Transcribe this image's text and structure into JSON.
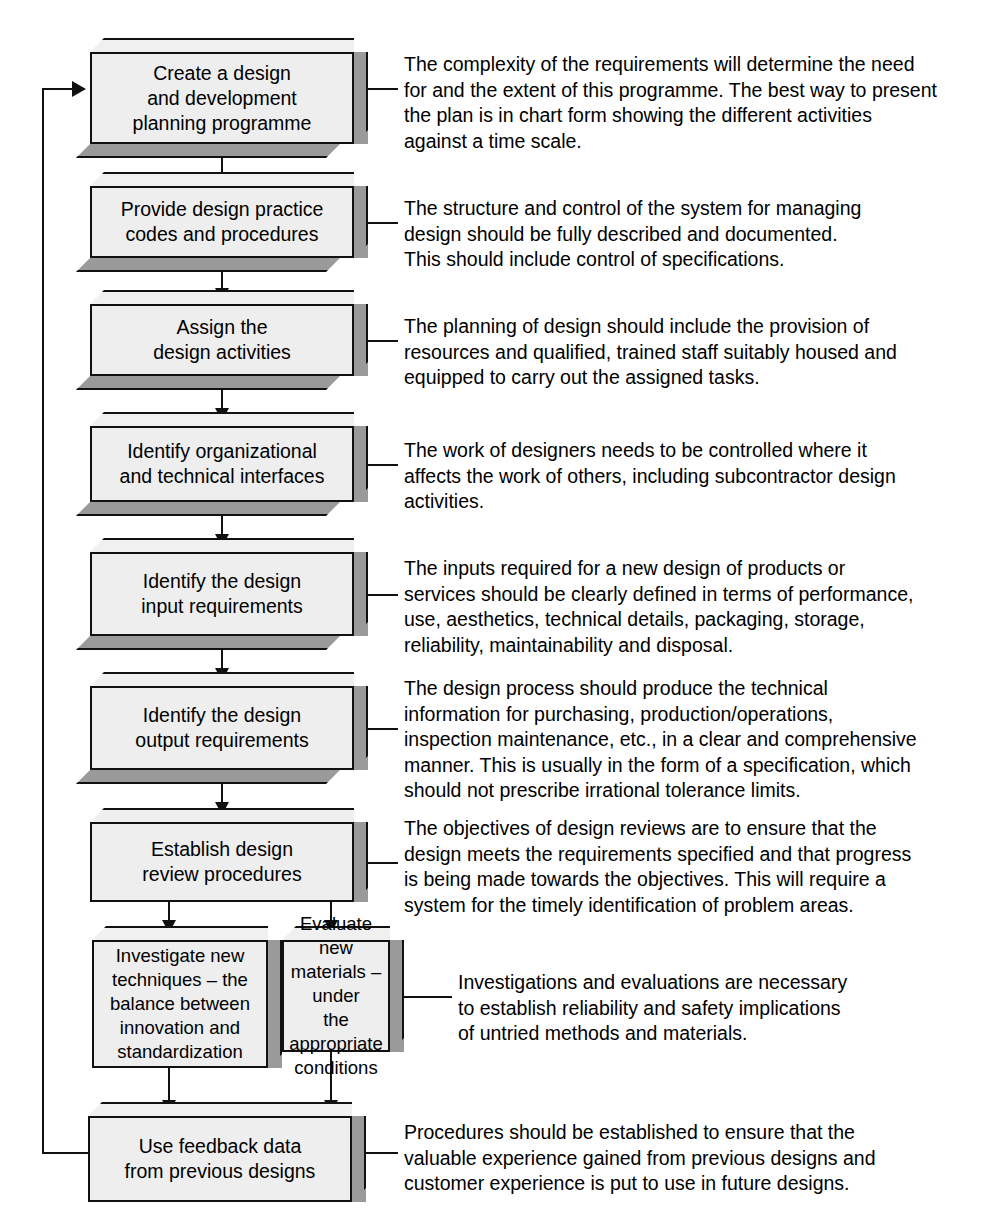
{
  "diagram": {
    "colors": {
      "box_face": "#eeeeee",
      "box_extrusion": "#9a9a9a",
      "box_top": "#f0f0f0",
      "line": "#111111",
      "background": "#ffffff"
    },
    "steps": [
      {
        "id": "create-design-planning-programme",
        "label": "Create a design\nand development\nplanning programme",
        "note": "The complexity of the requirements will determine the need\nfor and the extent of this programme. The best way to present\nthe plan is in chart form showing the different activities\nagainst a time scale."
      },
      {
        "id": "provide-design-practice-codes",
        "label": "Provide design practice\ncodes and procedures",
        "note": "The structure and control of the system for managing\ndesign should be fully described and documented.\nThis should include control of specifications."
      },
      {
        "id": "assign-design-activities",
        "label": "Assign the\ndesign activities",
        "note": "The planning of design should include the provision of\nresources and qualified, trained staff suitably housed and\nequipped to carry out the assigned tasks."
      },
      {
        "id": "identify-interfaces",
        "label": "Identify organizational\nand technical interfaces",
        "note": "The work of designers needs to be controlled where it\naffects the work of others, including subcontractor design\nactivities."
      },
      {
        "id": "identify-design-input",
        "label": "Identify the design\ninput requirements",
        "note": "The inputs required for a new design of products or\nservices should be clearly defined in terms of performance,\nuse, aesthetics, technical details, packaging, storage,\nreliability, maintainability and disposal."
      },
      {
        "id": "identify-design-output",
        "label": "Identify the design\noutput requirements",
        "note": "The design process should produce the technical\ninformation for purchasing, production/operations,\ninspection maintenance, etc., in a clear and comprehensive\nmanner. This is usually in the form of a specification, which\nshould not prescribe irrational tolerance limits."
      },
      {
        "id": "establish-design-review",
        "label": "Establish design\nreview procedures",
        "note": "The objectives of design reviews are to ensure that the\ndesign meets the requirements specified and that progress\nis being made towards the objectives. This will require a\nsystem for the timely identification of problem areas."
      },
      {
        "id": "investigate-new-techniques",
        "label": "Investigate new\ntechniques – the\nbalance between\ninnovation and\nstandardization",
        "note": ""
      },
      {
        "id": "evaluate-new-materials",
        "label": "Evaluate new\nmaterials – under\nthe appropriate\nconditions",
        "note": "Investigations and evaluations are necessary\nto establish reliability and safety implications\nof untried methods and materials."
      },
      {
        "id": "use-feedback-data",
        "label": "Use feedback data\nfrom previous designs",
        "note": "Procedures should be established to ensure that the\nvaluable experience gained from previous designs and\ncustomer experience is put to use in future designs."
      }
    ]
  }
}
